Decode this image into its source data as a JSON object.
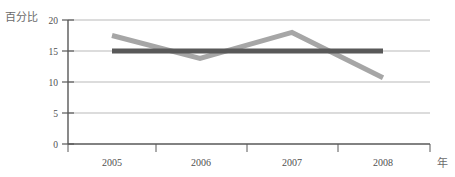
{
  "chart_data": {
    "type": "line",
    "title": "",
    "subtitle": "",
    "xlabel": "年",
    "ylabel": "百分比",
    "categories": [
      "2005",
      "2006",
      "2007",
      "2008"
    ],
    "x": [
      2005,
      2006,
      2007,
      2008
    ],
    "ylim": [
      0,
      20
    ],
    "yticks": [
      0,
      5,
      10,
      15,
      20
    ],
    "ytick_labels": [
      "0",
      "5",
      "10",
      "15",
      "20"
    ],
    "xtick_labels": [
      "2005",
      "2006",
      "2007",
      "2008"
    ],
    "grid": true,
    "grid_axis": "y",
    "legend": false,
    "legend_position": "none",
    "series": [
      {
        "name": "series-dark",
        "color": "#595959",
        "line_width": 5,
        "values": [
          15.0,
          15.0,
          15.0,
          15.0
        ]
      },
      {
        "name": "series-gray",
        "color": "#a6a6a6",
        "line_width": 5,
        "values": [
          17.5,
          13.8,
          18.0,
          10.7
        ]
      }
    ]
  },
  "labels": {
    "y_axis_title": "百分比",
    "x_axis_title": "年",
    "y_ticks": [
      "20",
      "15",
      "10",
      "5",
      "0"
    ],
    "x_ticks": [
      "2005",
      "2006",
      "2007",
      "2008"
    ]
  },
  "colors": {
    "background": "#ffffff",
    "axis": "#585858",
    "gridline": "#b9b9b9",
    "series_dark": "#595959",
    "series_gray": "#a6a6a6",
    "text": "#4f4f4f",
    "axis_title_text": "#6b6b6b"
  }
}
